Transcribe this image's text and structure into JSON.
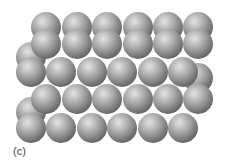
{
  "figure": {
    "caption": "(c)",
    "sphere_color": "#9a9a9a",
    "highlight_color": "#e8e8e8",
    "shadow_color": "#5e5e5e",
    "radius": 15,
    "spheres": [
      {
        "x": 31,
        "y": 57
      },
      {
        "x": 31,
        "y": 112
      },
      {
        "x": 46,
        "y": 27
      },
      {
        "x": 77,
        "y": 27
      },
      {
        "x": 107,
        "y": 27
      },
      {
        "x": 138,
        "y": 27
      },
      {
        "x": 168,
        "y": 27
      },
      {
        "x": 198,
        "y": 27
      },
      {
        "x": 46,
        "y": 44
      },
      {
        "x": 77,
        "y": 44
      },
      {
        "x": 107,
        "y": 44
      },
      {
        "x": 138,
        "y": 44
      },
      {
        "x": 168,
        "y": 44
      },
      {
        "x": 198,
        "y": 44
      },
      {
        "x": 198,
        "y": 78
      },
      {
        "x": 31,
        "y": 72
      },
      {
        "x": 61,
        "y": 72
      },
      {
        "x": 92,
        "y": 72
      },
      {
        "x": 122,
        "y": 72
      },
      {
        "x": 153,
        "y": 72
      },
      {
        "x": 183,
        "y": 72
      },
      {
        "x": 46,
        "y": 99
      },
      {
        "x": 77,
        "y": 99
      },
      {
        "x": 107,
        "y": 99
      },
      {
        "x": 138,
        "y": 99
      },
      {
        "x": 168,
        "y": 99
      },
      {
        "x": 198,
        "y": 99
      },
      {
        "x": 31,
        "y": 128
      },
      {
        "x": 61,
        "y": 128
      },
      {
        "x": 92,
        "y": 128
      },
      {
        "x": 122,
        "y": 128
      },
      {
        "x": 153,
        "y": 128
      },
      {
        "x": 183,
        "y": 128
      }
    ]
  }
}
